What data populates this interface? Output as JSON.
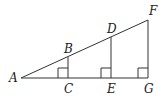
{
  "diagram": {
    "colors": {
      "line": "#333333",
      "label": "#222222",
      "background": "#ffffff"
    },
    "points": {
      "A": {
        "label": "A",
        "x": 21,
        "y": 78
      },
      "B": {
        "label": "B",
        "x": 68,
        "y": 57
      },
      "C": {
        "label": "C",
        "x": 68,
        "y": 78
      },
      "D": {
        "label": "D",
        "x": 111,
        "y": 37
      },
      "E": {
        "label": "E",
        "x": 111,
        "y": 78
      },
      "F": {
        "label": "F",
        "x": 148,
        "y": 20
      },
      "G": {
        "label": "G",
        "x": 148,
        "y": 78
      }
    },
    "segments": [
      "AF",
      "AG",
      "BC",
      "DE",
      "FG"
    ],
    "right_angles": [
      "C",
      "E",
      "G"
    ]
  }
}
